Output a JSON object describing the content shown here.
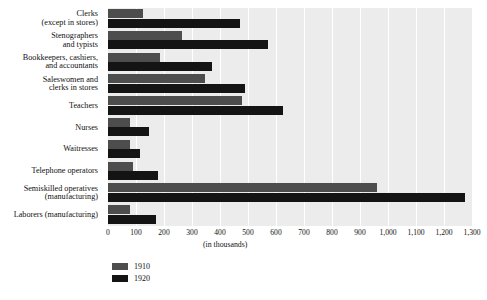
{
  "chart_data": {
    "type": "bar",
    "orientation": "horizontal",
    "title": "",
    "subtitle": "",
    "xlabel": "(in thousands)",
    "ylabel": "",
    "xlim": [
      0,
      1300
    ],
    "xticks": [
      0,
      100,
      200,
      300,
      400,
      500,
      600,
      700,
      800,
      900,
      1000,
      1100,
      1200,
      1300
    ],
    "xtick_labels": [
      "0",
      "100",
      "200",
      "300",
      "400",
      "500",
      "600",
      "700",
      "800",
      "900",
      "1,000",
      "1,100",
      "1,200",
      "1,300"
    ],
    "grid": true,
    "grid_axis": "x",
    "legend_position": "bottom-left",
    "categories": [
      "Clerks\n(except in stores)",
      "Stenographers\nand typists",
      "Bookkeepers, cashiers,\nand accountants",
      "Saleswomen and\nclerks in stores",
      "Teachers",
      "Nurses",
      "Waitresses",
      "Telephone operators",
      "Semiskilled operatives\n(manufacturing)",
      "Laborers (manufacturing)"
    ],
    "category_lines": [
      [
        "Clerks",
        "(except in stores)"
      ],
      [
        "Stenographers",
        "and typists"
      ],
      [
        "Bookkeepers, cashiers,",
        "and accountants"
      ],
      [
        "Saleswomen and",
        "clerks in stores"
      ],
      [
        "Teachers"
      ],
      [
        "Nurses"
      ],
      [
        "Waitresses"
      ],
      [
        "Telephone operators"
      ],
      [
        "Semiskilled operatives",
        "(manufacturing)"
      ],
      [
        "Laborers (manufacturing)"
      ]
    ],
    "series": [
      {
        "name": "1910",
        "color": "#4d4d4d",
        "values": [
          125,
          265,
          185,
          345,
          480,
          80,
          80,
          90,
          960,
          80
        ]
      },
      {
        "name": "1920",
        "color": "#141414",
        "values": [
          470,
          570,
          370,
          490,
          625,
          145,
          115,
          180,
          1275,
          170
        ]
      }
    ]
  },
  "legend": {
    "items": [
      {
        "label": "1910",
        "color": "#4d4d4d"
      },
      {
        "label": "1920",
        "color": "#141414"
      }
    ]
  },
  "axis_caption": "(in thousands)"
}
